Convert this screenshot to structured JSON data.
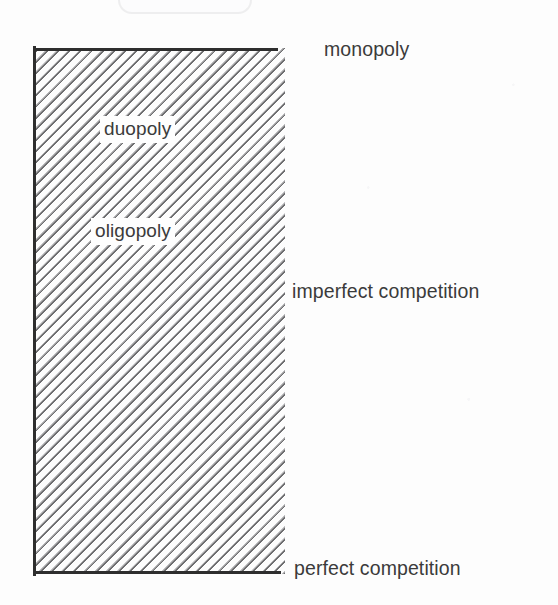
{
  "figure": {
    "kind": "market-structure-spectrum-diagram",
    "background_color": "#fdfdfd",
    "ink_color": "#3b3b3b",
    "border_color": "#2e2e2e",
    "hatch_color": "#6e6e70"
  },
  "block": {
    "name": "hatched-market-structure-bar",
    "hatch_direction": "diagonal-descending-45deg",
    "borders_drawn": "left, top, bottom",
    "right_edge": "ragged-open"
  },
  "inner_labels": [
    {
      "id": "duopoly",
      "text": "duopoly"
    },
    {
      "id": "oligopoly",
      "text": "oligopoly"
    }
  ],
  "side_labels": [
    {
      "id": "monopoly",
      "text": "monopoly"
    },
    {
      "id": "imperfect-competition",
      "text": "imperfect competition"
    },
    {
      "id": "perfect-competition",
      "text": "perfect competition"
    }
  ],
  "chart_data": {
    "type": "bar",
    "title": "",
    "xlabel": "",
    "ylabel": "",
    "orientation": "vertical",
    "grid": false,
    "legend": false,
    "axis_labels_top_to_bottom": [
      "monopoly",
      "duopoly",
      "oligopoly",
      "imperfect competition",
      "perfect competition"
    ],
    "categories": [
      "monopoly",
      "duopoly",
      "oligopoly",
      "imperfect competition",
      "perfect competition"
    ],
    "values": [
      1,
      2,
      3,
      4,
      5
    ],
    "annotations": [
      {
        "text": "monopoly",
        "position": "outside-right-top"
      },
      {
        "text": "duopoly",
        "position": "inside-upper"
      },
      {
        "text": "oligopoly",
        "position": "inside-upper-middle"
      },
      {
        "text": "imperfect competition",
        "position": "outside-right-middle"
      },
      {
        "text": "perfect competition",
        "position": "outside-right-bottom"
      }
    ]
  }
}
